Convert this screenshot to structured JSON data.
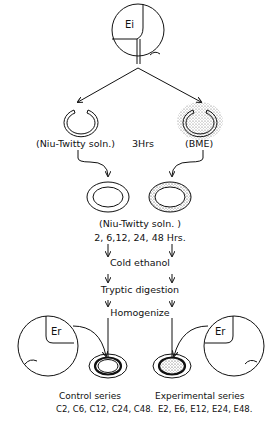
{
  "top": {
    "embryo_label": "Ei"
  },
  "stage1": {
    "left_label": "(Niu-Twitty soln.)",
    "middle_label": "3Hrs",
    "right_label": "(BME)"
  },
  "stage2": {
    "medium_label": "(Niu-Twitty  soln. )",
    "times_label": "2, 6,12, 24, 48  Hrs."
  },
  "steps": [
    {
      "label": "Cold  ethanol"
    },
    {
      "label": "Tryptic digestion"
    },
    {
      "label": "Homogenize"
    }
  ],
  "bottom": {
    "left_embryo_label": "Er",
    "right_embryo_label": "Er",
    "control": {
      "title": "Control series",
      "codes": "C2, C6, C12, C24, C48."
    },
    "experimental": {
      "title": "Experimental series",
      "codes": "E2, E6, E12, E24, E48."
    }
  },
  "colors": {
    "stroke": "#111111",
    "background": "#ffffff",
    "stipple": "#555555"
  }
}
